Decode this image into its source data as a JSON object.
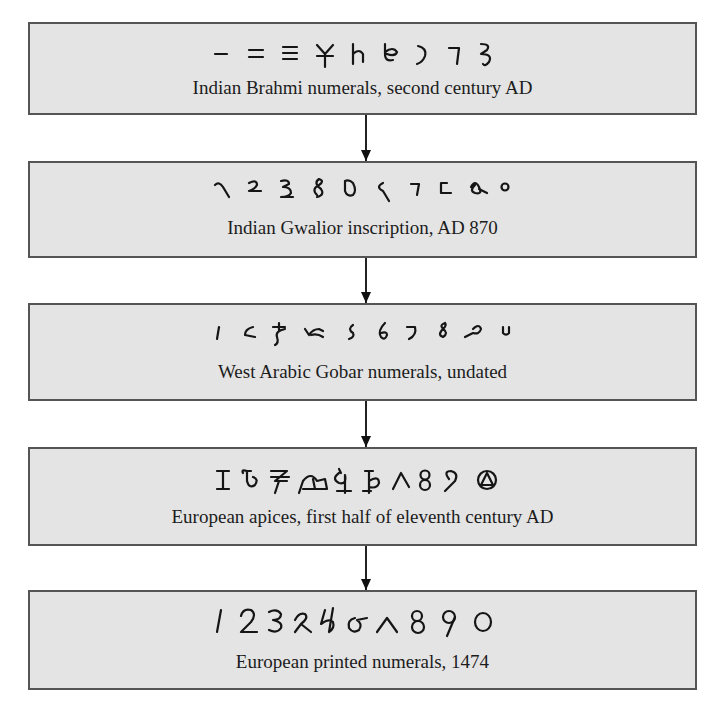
{
  "diagram": {
    "type": "flowchart",
    "direction": "top-to-bottom",
    "colors": {
      "box_fill": "#e4e4e4",
      "box_border": "#555555",
      "arrow": "#111111",
      "text": "#1c1c1c"
    },
    "stages": [
      {
        "id": "brahmi",
        "numerals_description": "Brahmi numeral glyphs 1–9",
        "numeral_values": [
          "1",
          "2",
          "3",
          "4",
          "5",
          "6",
          "7",
          "8",
          "9"
        ],
        "caption": "Indian Brahmi numerals, second century AD"
      },
      {
        "id": "gwalior",
        "numerals_description": "Gwalior inscription numeral glyphs 1–9 and 0",
        "numeral_values": [
          "1",
          "2",
          "3",
          "4",
          "5",
          "6",
          "7",
          "8",
          "9",
          "0"
        ],
        "caption": "Indian Gwalior inscription, AD 870"
      },
      {
        "id": "gobar",
        "numerals_description": "West Arabic Gobar numeral glyphs 1–9 and 0",
        "numeral_values": [
          "1",
          "2",
          "3",
          "4",
          "5",
          "6",
          "7",
          "8",
          "9",
          "0"
        ],
        "caption": "West Arabic Gobar numerals, undated"
      },
      {
        "id": "apices",
        "numerals_description": "European apices numeral glyphs 1–9 and 0",
        "numeral_values": [
          "1",
          "2",
          "3",
          "4",
          "5",
          "6",
          "7",
          "8",
          "9",
          "0"
        ],
        "caption": "European apices, first half of eleventh century AD"
      },
      {
        "id": "printed",
        "numerals_description": "European printed numeral glyphs 1–9 and 0",
        "numeral_values": [
          "1",
          "2",
          "3",
          "4",
          "5",
          "6",
          "7",
          "8",
          "9",
          "0"
        ],
        "caption": "European printed numerals, 1474"
      }
    ],
    "arrows": [
      {
        "from": "brahmi",
        "to": "gwalior"
      },
      {
        "from": "gwalior",
        "to": "gobar"
      },
      {
        "from": "gobar",
        "to": "apices"
      },
      {
        "from": "apices",
        "to": "printed"
      }
    ]
  }
}
